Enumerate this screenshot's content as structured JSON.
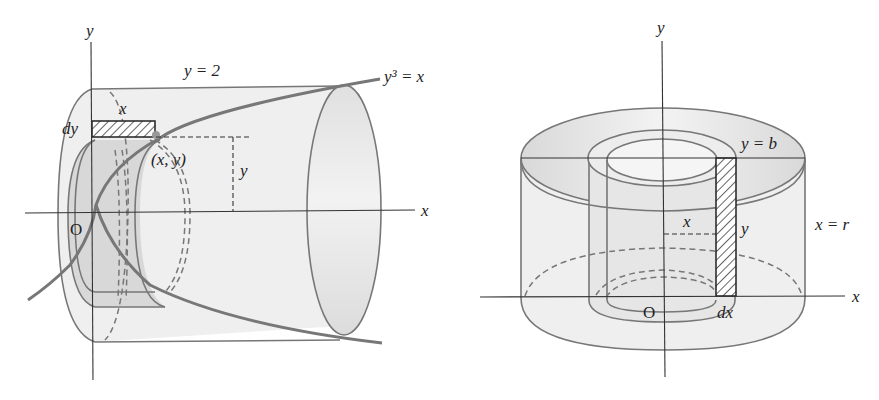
{
  "figures": [
    {
      "id": "left",
      "description": "Solid of revolution generated by rotating region bounded by y^3 = x and y = 2 about the x-axis, shell method with horizontal strip",
      "labels": {
        "y_axis": "y",
        "x_axis": "x",
        "origin": "O",
        "top_line": "y = 2",
        "curve": "y³ = x",
        "strip_length": "x",
        "strip_width": "dy",
        "point": "(x, y)",
        "height": "y"
      }
    },
    {
      "id": "right",
      "description": "Cylindrical shell with vertical strip, height y = b and radius x = r",
      "labels": {
        "y_axis": "y",
        "x_axis": "x",
        "origin": "O",
        "top_line": "y = b",
        "outer_radius": "x = r",
        "radius": "x",
        "height": "y",
        "strip_width": "dx"
      }
    }
  ],
  "colors": {
    "shade_light": "#ececec",
    "shade_mid": "#d6d6d6",
    "edge": "#777777",
    "axis": "#333333"
  }
}
